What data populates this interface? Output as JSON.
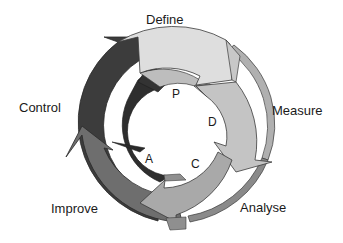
{
  "diagram": {
    "outer_stages": [
      {
        "id": "define",
        "label": "Define",
        "color": "#dedede"
      },
      {
        "id": "measure",
        "label": "Measure",
        "color": "#c4c4c4"
      },
      {
        "id": "analyse",
        "label": "Analyse",
        "color": "#a9a9a9"
      },
      {
        "id": "improve",
        "label": "Improve",
        "color": "#6e6e6e"
      },
      {
        "id": "control",
        "label": "Control",
        "color": "#3c3c3c"
      }
    ],
    "inner_stages": [
      {
        "id": "plan",
        "label": "P",
        "color": "#bdbdbd"
      },
      {
        "id": "do",
        "label": "D",
        "color": "#b5b5b5"
      },
      {
        "id": "check",
        "label": "C",
        "color": "#8f8f8f"
      },
      {
        "id": "act",
        "label": "A",
        "color": "#2e2e2e"
      }
    ],
    "outline_color": "#3a3a3a",
    "background": "#ffffff"
  }
}
